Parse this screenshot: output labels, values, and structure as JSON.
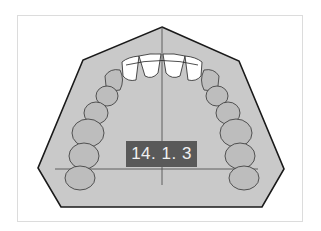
{
  "figure": {
    "label": "14. 1. 3",
    "colors": {
      "palate_fill": "#c9c9c9",
      "outline": "#1a1a1a",
      "tooth_fill": "#bdbdbd",
      "incisor_fill": "#ffffff",
      "label_bg": "#595959",
      "label_text": "#f0f0f0"
    }
  }
}
